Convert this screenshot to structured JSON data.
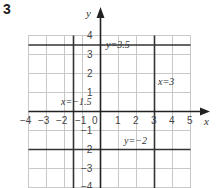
{
  "question_number": "3",
  "axes": {
    "x_label": "x",
    "y_label": "y"
  },
  "x_ticks": [
    "−4",
    "−3",
    "−2",
    "−1",
    "0",
    "1",
    "2",
    "3",
    "4",
    "5"
  ],
  "y_ticks": [
    "4",
    "3",
    "2",
    "1",
    "−1",
    "−2",
    "−3",
    "−4"
  ],
  "lines": [
    {
      "equation": "y=3.5",
      "orientation": "horizontal",
      "value": 3.5
    },
    {
      "equation": "x=3",
      "orientation": "vertical",
      "value": 3
    },
    {
      "equation": "x=−1.5",
      "orientation": "vertical",
      "value": -1.5
    },
    {
      "equation": "y=−2",
      "orientation": "horizontal",
      "value": -2
    }
  ],
  "grid": {
    "x_range": [
      -4,
      5
    ],
    "y_range": [
      -4,
      4
    ],
    "step": 1
  }
}
